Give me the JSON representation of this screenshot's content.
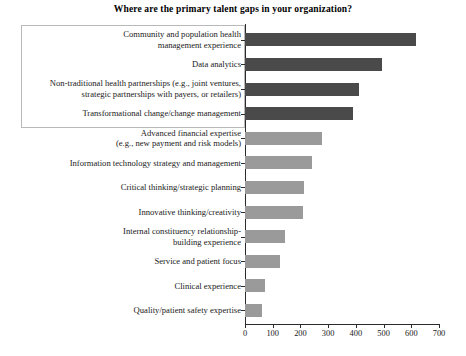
{
  "chart_data": {
    "type": "bar",
    "orientation": "horizontal",
    "title": "Where are the primary talent gaps in your organization?",
    "xlabel": "",
    "ylabel": "",
    "xlim": [
      0,
      700
    ],
    "xticks": [
      0,
      100,
      200,
      300,
      400,
      500,
      600,
      700
    ],
    "grid": false,
    "legend": false,
    "categories": [
      "Community and population health management experience",
      "Data analytics",
      "Non-traditional health partnerships (e.g., joint ventures, strategic partnerships with payers, or retailers)",
      "Transformational change/change management",
      "Advanced financial expertise (e.g., new payment and risk models)",
      "Information technology strategy and management",
      "Critical thinking/strategic planning",
      "Innovative thinking/creativity",
      "Internal constituency relationship-building experience",
      "Service and patient focus",
      "Clinical experience",
      "Quality/patient safety expertise"
    ],
    "values": [
      616,
      493,
      413,
      388,
      279,
      243,
      214,
      210,
      145,
      127,
      73,
      62
    ],
    "bar_colors": [
      "#4a4a4a",
      "#4a4a4a",
      "#4a4a4a",
      "#4a4a4a",
      "#9a9a9a",
      "#9a9a9a",
      "#9a9a9a",
      "#9a9a9a",
      "#9a9a9a",
      "#9a9a9a",
      "#9a9a9a",
      "#9a9a9a"
    ],
    "annotations": [
      {
        "type": "highlight-box",
        "note": "Rectangular outline enclosing the top four category labels"
      }
    ]
  },
  "category_label_lines": [
    [
      "Community and population health",
      "management experience"
    ],
    [
      "Data analytics"
    ],
    [
      "Non-traditional health partnerships (e.g., joint ventures,",
      "strategic partnerships with payers, or retailers)"
    ],
    [
      "Transformational change/change management"
    ],
    [
      "Advanced financial expertise",
      "(e.g., new payment and risk models)"
    ],
    [
      "Information technology strategy and management"
    ],
    [
      "Critical thinking/strategic planning"
    ],
    [
      "Innovative thinking/creativity"
    ],
    [
      "Internal constituency relationship-",
      "building experience"
    ],
    [
      "Service and patient focus"
    ],
    [
      "Clinical experience"
    ],
    [
      "Quality/patient safety expertise"
    ]
  ]
}
